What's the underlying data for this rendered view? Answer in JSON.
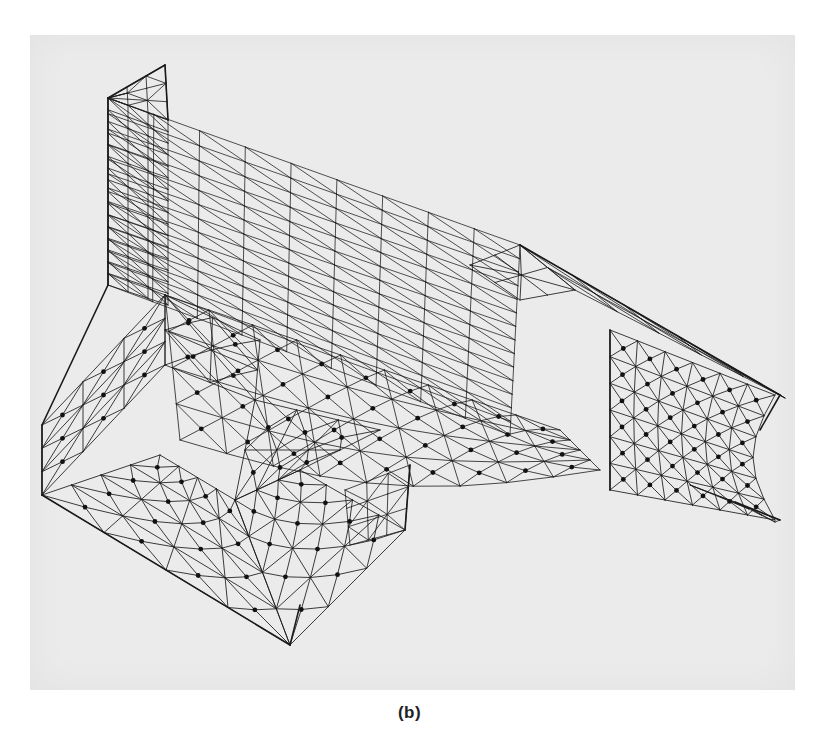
{
  "figure": {
    "caption": "(b)",
    "colors": {
      "paper": "#ebebeb",
      "background": "#ffffff",
      "mesh": "#1a1a1a"
    }
  }
}
